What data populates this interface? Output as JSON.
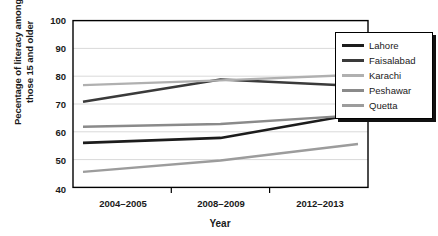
{
  "chart_data": {
    "type": "line",
    "title": "",
    "xlabel": "Year",
    "ylabel": "Pecentage of literacy among those 15 and older",
    "ylabel_line1": "Pecentage of literacy among",
    "ylabel_line2": "those 15 and older",
    "categories": [
      "2004–2005",
      "2008–2009",
      "2012–2013"
    ],
    "ylim": [
      40,
      100
    ],
    "ytick_labels": [
      "100",
      "90",
      "80",
      "70",
      "60",
      "50",
      "40"
    ],
    "ytick_values": [
      100,
      90,
      80,
      70,
      60,
      50,
      40
    ],
    "grid": "horizontal",
    "legend_position": "right-inside-top",
    "series": [
      {
        "name": "Lahore",
        "values": [
          56.0,
          57.8,
          66.5
        ],
        "color": "#1c1c1c",
        "width": 2.6
      },
      {
        "name": "Faisalabad",
        "values": [
          70.8,
          78.8,
          76.5
        ],
        "color": "#3a3a3a",
        "width": 2.6
      },
      {
        "name": "Karachi",
        "values": [
          76.8,
          78.5,
          80.5
        ],
        "color": "#b0b0b0",
        "width": 2.4
      },
      {
        "name": "Peshawar",
        "values": [
          61.8,
          62.8,
          66.0
        ],
        "color": "#8a8a8a",
        "width": 2.4
      },
      {
        "name": "Quetta",
        "values": [
          45.6,
          49.7,
          55.6
        ],
        "color": "#9c9c9c",
        "width": 2.4
      }
    ]
  },
  "axes": {
    "frame_color": "#000000",
    "grid_color": "#d9d9d9",
    "background": "#ffffff"
  }
}
